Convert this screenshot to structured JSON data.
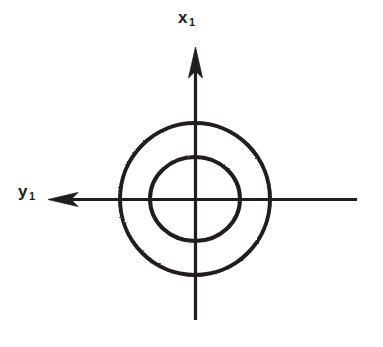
{
  "figure": {
    "kind": "line-diagram",
    "background_color": "#ffffff",
    "ink_color": "#201d1d",
    "width": 383,
    "height": 347,
    "labels": {
      "vertical_axis": {
        "symbol": "x",
        "subscript": "1",
        "text": "x1"
      },
      "horizontal_axis": {
        "symbol": "y",
        "subscript": "1",
        "text": "y1"
      }
    },
    "axes": [
      {
        "name": "x1-axis",
        "orientation": "vertical",
        "arrow_direction": "up",
        "x": 195,
        "y_start": 320,
        "y_end": 47,
        "stroke_width": 3
      },
      {
        "name": "y1-axis",
        "orientation": "horizontal",
        "arrow_direction": "left",
        "y": 199,
        "x_start": 357,
        "x_end": 48,
        "stroke_width": 3
      }
    ],
    "circles": [
      {
        "name": "outer-circle",
        "cx": 195,
        "cy": 199,
        "rx": 75,
        "ry": 76,
        "stroke_width": 4
      },
      {
        "name": "inner-circle",
        "cx": 195,
        "cy": 199,
        "rx": 45,
        "ry": 42,
        "stroke_width": 4
      }
    ],
    "origin": {
      "x": 195,
      "y": 199
    }
  }
}
